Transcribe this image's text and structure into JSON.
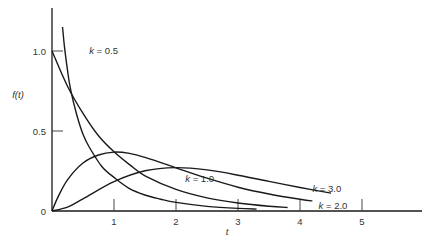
{
  "chart_data": {
    "type": "line",
    "title": "",
    "xlabel": "t",
    "ylabel": "f(t)",
    "xlim": [
      0,
      5.8
    ],
    "ylim": [
      0,
      1.2
    ],
    "grid": false,
    "legend": "inline labels",
    "x_ticks": [
      "1",
      "2",
      "3",
      "4",
      "5"
    ],
    "x_tick_values": [
      1,
      2,
      3,
      4,
      5
    ],
    "y_ticks": [
      "0",
      "0.5",
      "1.0"
    ],
    "y_tick_values": [
      0,
      0.5,
      1.0
    ],
    "series": [
      {
        "name": "k = 0.5",
        "label_pos": [
          0.6,
          1.0
        ],
        "x": [
          0.17,
          0.2,
          0.25,
          0.3,
          0.4,
          0.5,
          0.6,
          0.8,
          1.0,
          1.25,
          1.5,
          1.75,
          2.0,
          2.5,
          3.0,
          3.3
        ],
        "values": [
          1.15,
          1.03,
          0.88,
          0.76,
          0.6,
          0.48,
          0.4,
          0.28,
          0.21,
          0.14,
          0.1,
          0.074,
          0.054,
          0.029,
          0.016,
          0.012
        ]
      },
      {
        "name": "k = 1.0",
        "label_pos": [
          2.15,
          0.2
        ],
        "x": [
          0,
          0.25,
          0.5,
          0.75,
          1.0,
          1.25,
          1.5,
          2.0,
          2.5,
          3.0,
          3.5,
          3.8
        ],
        "values": [
          1.0,
          0.78,
          0.61,
          0.47,
          0.37,
          0.29,
          0.22,
          0.135,
          0.082,
          0.05,
          0.03,
          0.022
        ]
      },
      {
        "name": "k = 2.0",
        "label_pos": [
          4.3,
          0.03
        ],
        "x": [
          0,
          0.1,
          0.25,
          0.5,
          0.75,
          1.0,
          1.25,
          1.5,
          2.0,
          2.5,
          3.0,
          3.5,
          4.0,
          4.2
        ],
        "values": [
          0,
          0.09,
          0.195,
          0.3,
          0.35,
          0.368,
          0.36,
          0.335,
          0.27,
          0.205,
          0.149,
          0.106,
          0.073,
          0.063
        ]
      },
      {
        "name": "k = 3.0",
        "label_pos": [
          4.2,
          0.14
        ],
        "x": [
          0,
          0.25,
          0.5,
          1.0,
          1.5,
          2.0,
          2.5,
          3.0,
          3.5,
          4.0,
          4.5
        ],
        "values": [
          0,
          0.024,
          0.076,
          0.184,
          0.251,
          0.271,
          0.257,
          0.224,
          0.185,
          0.147,
          0.112
        ]
      }
    ]
  }
}
